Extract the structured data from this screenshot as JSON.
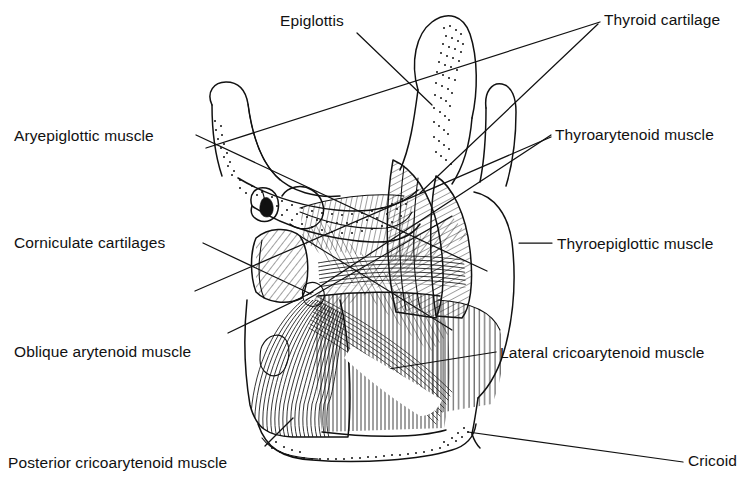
{
  "figure": {
    "background_color": "#ffffff",
    "ink_color": "#111111",
    "width": 746,
    "height": 486
  },
  "labels": {
    "epiglottis": "Epiglottis",
    "thyroid_cartilage": "Thyroid cartilage",
    "aryepiglottic_muscle": "Aryepiglottic muscle",
    "thyroarytenoid_muscle": "Thyroarytenoid muscle",
    "corniculate_cartilages": "Corniculate cartilages",
    "thyroepiglottic_muscle": "Thyroepiglottic muscle",
    "oblique_arytenoid_muscle": "Oblique arytenoid muscle",
    "lateral_cricoarytenoid_muscle": "Lateral cricoarytenoid muscle",
    "posterior_cricoarytenoid_muscle": "Posterior  cricoarytenoid muscle",
    "cricoid": "Cricoid"
  },
  "label_positions": {
    "epiglottis": {
      "x": 280,
      "y": 26
    },
    "thyroid_cartilage": {
      "x": 604,
      "y": 25
    },
    "aryepiglottic_muscle": {
      "x": 14,
      "y": 141
    },
    "thyroarytenoid_muscle": {
      "x": 555,
      "y": 140
    },
    "corniculate_cartilages": {
      "x": 14,
      "y": 248
    },
    "thyroepiglottic_muscle": {
      "x": 557,
      "y": 249
    },
    "oblique_arytenoid_muscle": {
      "x": 14,
      "y": 357
    },
    "lateral_cricoarytenoid_muscle": {
      "x": 500,
      "y": 358
    },
    "posterior_cricoarytenoid_muscle": {
      "x": 8,
      "y": 468
    },
    "cricoid": {
      "x": 688,
      "y": 466
    }
  },
  "leader_lines": {
    "epiglottis": "M 357 33 L 432 105",
    "thyroid_cartilage_upper": "M 600 22 L 206 148",
    "thyroid_cartilage_lower": "M 598 24 L 420 193",
    "aryepiglottic_muscle": "M 196 135 L 487 271",
    "thyroarytenoid_muscle_a": "M 551 135 L 307 295",
    "thyroarytenoid_muscle_b": "M 551 137 L 195 291",
    "corniculate_cartilages": "M 203 243 L 311 294",
    "thyroepiglottic_muscle": "M 552 243 L 519 243",
    "oblique_arytenoid_muscle": "M 228 333 L 313 292",
    "lateral_cricoarytenoid_muscle": "M 496 352 L 370 372",
    "posterior_cricoarytenoid_muscle": "M 265 446 L 293 418",
    "cricoid": "M 683 462 L 468 432"
  },
  "structures": [
    {
      "name": "epiglottis",
      "description": "leaf-shaped cartilage, upper centre"
    },
    {
      "name": "hyoid-greater-horn",
      "description": "hooked process, upper left"
    },
    {
      "name": "thyroid-cartilage-superior-horn",
      "description": "tall process, upper right"
    },
    {
      "name": "corniculate-cartilages",
      "description": "small paired nodules, mid left"
    },
    {
      "name": "arytenoid-cartilages",
      "description": "paired pyramids, centre"
    },
    {
      "name": "aryepiglottic-muscle",
      "description": "oblique striated band"
    },
    {
      "name": "thyroarytenoid-muscle",
      "description": "hatched band, right"
    },
    {
      "name": "thyroepiglottic-muscle",
      "description": "hatched band, right lower"
    },
    {
      "name": "oblique-arytenoid-muscle",
      "description": "crossing X fibres, centre"
    },
    {
      "name": "transverse-arytenoid-muscle",
      "description": "horizontal fibres, centre"
    },
    {
      "name": "posterior-cricoarytenoid-muscle",
      "description": "fan of fibres, lower left"
    },
    {
      "name": "lateral-cricoarytenoid-muscle",
      "description": "fibres, lower right"
    },
    {
      "name": "cricoid-cartilage",
      "description": "broad lamina, bottom"
    }
  ]
}
